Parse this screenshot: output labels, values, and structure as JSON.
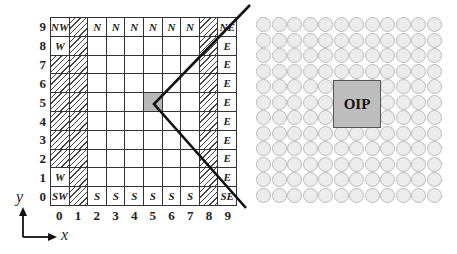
{
  "grid": {
    "columns": 10,
    "rows": 10,
    "x_ticks": [
      "0",
      "1",
      "2",
      "3",
      "4",
      "5",
      "6",
      "7",
      "8",
      "9"
    ],
    "y_ticks": [
      "9",
      "8",
      "7",
      "6",
      "5",
      "4",
      "3",
      "2",
      "1",
      "0"
    ],
    "cells_top_to_bottom": [
      [
        "NW",
        "#",
        "N",
        "N",
        "N",
        "N",
        "N",
        "N",
        "#",
        "NE"
      ],
      [
        "W",
        "#",
        "",
        "",
        "",
        "",
        "",
        "",
        "#",
        "E"
      ],
      [
        "#",
        "#",
        "",
        "",
        "",
        "",
        "",
        "",
        "#",
        "E"
      ],
      [
        "#",
        "#",
        "",
        "",
        "",
        "",
        "",
        "",
        "#",
        "E"
      ],
      [
        "#",
        "#",
        "",
        "",
        "",
        "*",
        "",
        "",
        "#",
        "E"
      ],
      [
        "#",
        "#",
        "",
        "",
        "",
        "",
        "",
        "",
        "#",
        "E"
      ],
      [
        "#",
        "#",
        "",
        "",
        "",
        "",
        "",
        "",
        "#",
        "E"
      ],
      [
        "#",
        "#",
        "",
        "",
        "",
        "",
        "",
        "",
        "#",
        "E"
      ],
      [
        "W",
        "#",
        "",
        "",
        "",
        "",
        "",
        "",
        "#",
        "E"
      ],
      [
        "SW",
        "#",
        "S",
        "S",
        "S",
        "S",
        "S",
        "S",
        "#",
        "SE"
      ]
    ],
    "legend": {
      "#": "hatched cell",
      "*": "shaded center cell (5,5)"
    }
  },
  "axes": {
    "x_label": "x",
    "y_label": "y"
  },
  "wedge_lines": {
    "vertex": [
      154,
      104
    ],
    "upper_end": [
      250,
      5
    ],
    "lower_end": [
      246,
      208
    ],
    "color": "#111111"
  },
  "circle_array": {
    "columns": 12,
    "rows": 12,
    "fill": "#ececec",
    "stroke": "#bbbbbb"
  },
  "oip_box": {
    "label": "OIP",
    "fill": "#bdbdbd"
  }
}
